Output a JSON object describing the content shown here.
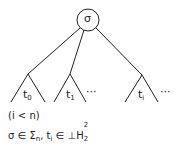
{
  "diagram": {
    "root": {
      "label": "σ"
    },
    "subtrees": [
      {
        "name": "t",
        "index": "0",
        "ellipsis": ""
      },
      {
        "name": "t",
        "index": "1",
        "ellipsis": "···"
      },
      {
        "name": "t",
        "index": "i",
        "ellipsis": "···"
      }
    ],
    "condition": "(i < n)",
    "typing": {
      "part1": "σ ∈ Σ",
      "part1_sub": "n",
      "sep": ", t",
      "t_sub": "i",
      "part2": " ∈ ⊥H",
      "h_sub": "2",
      "h_sup": "2"
    }
  }
}
